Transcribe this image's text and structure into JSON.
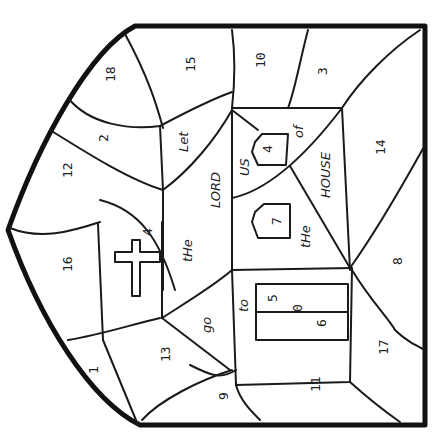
{
  "page": {
    "orientation": "rotated-90-clockwise"
  },
  "regions": [
    {
      "id": "r18",
      "label": "18",
      "x": 115,
      "y": 82
    },
    {
      "id": "r15",
      "label": "15",
      "x": 195,
      "y": 72
    },
    {
      "id": "r2",
      "label": "2",
      "x": 108,
      "y": 142
    },
    {
      "id": "r12",
      "label": "12",
      "x": 72,
      "y": 178
    },
    {
      "id": "r10",
      "label": "10",
      "x": 265,
      "y": 68
    },
    {
      "id": "r3",
      "label": "3",
      "x": 327,
      "y": 75
    },
    {
      "id": "r4top",
      "label": "4",
      "x": 272,
      "y": 148
    },
    {
      "id": "r14",
      "label": "14",
      "x": 385,
      "y": 150
    },
    {
      "id": "r16",
      "label": "16",
      "x": 66,
      "y": 267
    },
    {
      "id": "r4cross",
      "label": "4",
      "x": 147,
      "y": 232
    },
    {
      "id": "r7",
      "label": "7",
      "x": 276,
      "y": 218
    },
    {
      "id": "r8",
      "label": "8",
      "x": 398,
      "y": 260
    },
    {
      "id": "r1",
      "label": "1",
      "x": 95,
      "y": 370
    },
    {
      "id": "r13",
      "label": "13",
      "x": 165,
      "y": 355
    },
    {
      "id": "r9",
      "label": "9",
      "x": 224,
      "y": 395
    },
    {
      "id": "r5",
      "label": "5",
      "x": 273,
      "y": 297
    },
    {
      "id": "r0",
      "label": "0",
      "x": 298,
      "y": 307
    },
    {
      "id": "r6",
      "label": "6",
      "x": 322,
      "y": 322
    },
    {
      "id": "r17",
      "label": "17",
      "x": 384,
      "y": 348
    },
    {
      "id": "r11",
      "label": "11",
      "x": 315,
      "y": 385
    }
  ],
  "words": [
    {
      "id": "w-let",
      "text": "Let",
      "x": 183,
      "y": 140
    },
    {
      "id": "w-lord",
      "text": "LORD",
      "x": 220,
      "y": 190
    },
    {
      "id": "w-us",
      "text": "US",
      "x": 247,
      "y": 168
    },
    {
      "id": "w-of",
      "text": "of",
      "x": 302,
      "y": 131
    },
    {
      "id": "w-house",
      "text": "HOUSE",
      "x": 330,
      "y": 172
    },
    {
      "id": "w-the1",
      "text": "tHe",
      "x": 188,
      "y": 248
    },
    {
      "id": "w-the2",
      "text": "tHe",
      "x": 308,
      "y": 228
    },
    {
      "id": "w-go",
      "text": "go",
      "x": 207,
      "y": 322
    },
    {
      "id": "w-to",
      "text": "to",
      "x": 244,
      "y": 303
    }
  ],
  "colors": {
    "ink": "#111111",
    "paper": "#ffffff"
  }
}
